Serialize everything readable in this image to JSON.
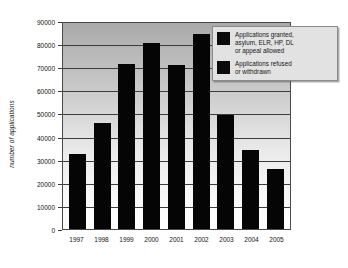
{
  "chart_data": {
    "type": "bar",
    "title": "",
    "xlabel": "",
    "ylabel": "number of applications",
    "categories": [
      "1997",
      "1998",
      "1999",
      "2000",
      "2001",
      "2002",
      "2003",
      "2004",
      "2005"
    ],
    "values": [
      32500,
      46000,
      71500,
      80500,
      71000,
      84500,
      49500,
      34000,
      25800
    ],
    "series": [
      {
        "name": "Applications refused\nor withdrawn",
        "values": [
          32500,
          46000,
          71500,
          80500,
          71000,
          84500,
          49500,
          34000,
          25800
        ]
      }
    ],
    "ylim": [
      0,
      90000
    ],
    "y_ticks": [
      0,
      10000,
      20000,
      30000,
      40000,
      50000,
      60000,
      70000,
      80000,
      90000
    ],
    "y_tick_labels": [
      "0",
      "10000",
      "20000",
      "30000",
      "40000",
      "50000",
      "60000",
      "70000",
      "80000",
      "90000"
    ],
    "grid": true,
    "legend_position": "top-right",
    "legend_entries": [
      "Applications granted,\nasylum, ELR, HP, DL\nor appeal allowed",
      "Applications refused\nor withdrawn"
    ],
    "colors": {
      "bar": "#050505",
      "gridline": "#3c3c3c",
      "plot_border": "#4a4a4a",
      "legend_background": "#e2e2e2",
      "legend_border": "#8a8a8a",
      "page_background": "#ffffff",
      "text": "#111111"
    }
  },
  "axes": {
    "y_title": "number of applications"
  },
  "legend": {
    "items": [
      {
        "label": "Applications granted,\nasylum, ELR, HP, DL\nor appeal allowed",
        "swatch_name": "legend-swatch-granted"
      },
      {
        "label": "Applications refused\nor withdrawn",
        "swatch_name": "legend-swatch-refused"
      }
    ]
  }
}
